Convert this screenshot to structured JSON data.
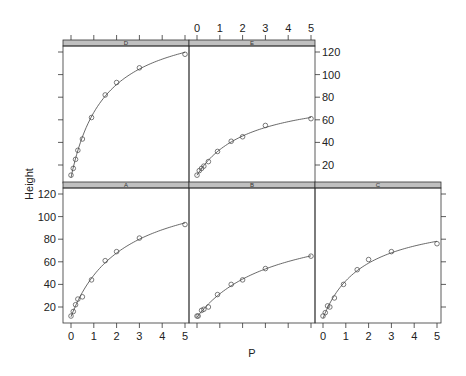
{
  "chart_data": {
    "type": "scatter",
    "layout": "trellis 3 columns x 2 rows",
    "xlabel": "P",
    "ylabel": "Height",
    "xlim": [
      -0.1,
      5.1
    ],
    "ylim": [
      5,
      125
    ],
    "x_ticks": [
      0,
      1,
      2,
      3,
      4,
      5
    ],
    "y_ticks": [
      20,
      40,
      60,
      80,
      100,
      120
    ],
    "grid": false,
    "line": "fitted saturating curve",
    "strip_color": "#c0c0c0",
    "panels": [
      {
        "name": "D",
        "row": "top",
        "col": 0,
        "x": [
          0,
          0.1,
          0.2,
          0.3,
          0.5,
          0.9,
          1.5,
          2,
          3,
          5
        ],
        "y": [
          11,
          17,
          25,
          33,
          43,
          62,
          82,
          93,
          106,
          118
        ]
      },
      {
        "name": "E",
        "row": "top",
        "col": 1,
        "x": [
          0,
          0.1,
          0.2,
          0.3,
          0.5,
          0.9,
          1.5,
          2,
          3,
          5
        ],
        "y": [
          11,
          15,
          17,
          19,
          23,
          32,
          41,
          45,
          55,
          61
        ]
      },
      {
        "name": "A",
        "row": "bottom",
        "col": 0,
        "x": [
          0,
          0.1,
          0.2,
          0.3,
          0.5,
          0.9,
          1.5,
          2,
          3,
          5
        ],
        "y": [
          12,
          16,
          22,
          27,
          29,
          44,
          61,
          69,
          81,
          93
        ]
      },
      {
        "name": "B",
        "row": "bottom",
        "col": 1,
        "x": [
          0,
          0.05,
          0.2,
          0.3,
          0.5,
          0.9,
          1.5,
          2,
          3,
          5
        ],
        "y": [
          12,
          12,
          17,
          18,
          20,
          31,
          40,
          44,
          54,
          65
        ]
      },
      {
        "name": "C",
        "row": "bottom",
        "col": 2,
        "x": [
          0,
          0.1,
          0.2,
          0.3,
          0.5,
          0.9,
          1.5,
          2,
          3,
          5
        ],
        "y": [
          12,
          15,
          21,
          20,
          28,
          40,
          53,
          62,
          69,
          76
        ]
      }
    ]
  }
}
